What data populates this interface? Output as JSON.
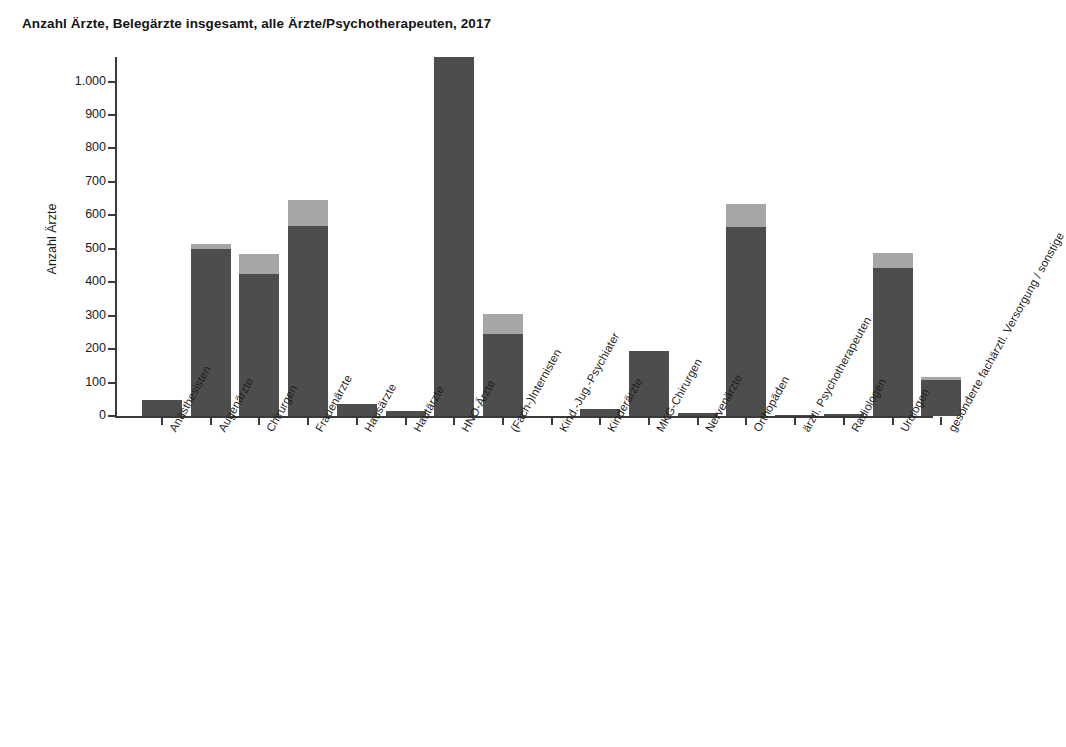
{
  "chart_data": {
    "type": "bar",
    "title": "Anzahl Ärzte, Belegärzte insgesamt, alle Ärzte/Psychotherapeuten, 2017",
    "xlabel": "",
    "ylabel": "Anzahl Ärzte",
    "ylim": [
      0,
      1100
    ],
    "ytick_labels": [
      "1.000",
      "900",
      "800",
      "700",
      "600",
      "500",
      "400",
      "300",
      "200",
      "100",
      "0"
    ],
    "ytick_values": [
      1000,
      900,
      800,
      700,
      600,
      500,
      400,
      300,
      200,
      100,
      0
    ],
    "grid": false,
    "legend": "none",
    "stacked": true,
    "note": "Gestapelte Balken: dunkelgrauer Sockel und hellgraues Segment obenauf. Der Balken HNO-Ärzte ist oben abgeschnitten.",
    "categories": [
      "Anästhesisten",
      "Augenärzte",
      "Chirurgen",
      "Frauenärzte",
      "Hausärzte",
      "Hautärzte",
      "HNO-Ärzte",
      "(Fach-)Internisten",
      "Kind.-Jug.-Psychiater",
      "Kinderärzte",
      "MKG-Chirurgen",
      "Nervenärzte",
      "Orthopäden",
      "ärztl. Psychotherapeuten",
      "Radiologen",
      "Urologen",
      "gesonderte fachärztl. Versorgung / sonstige"
    ],
    "series": [
      {
        "name": "Belegärzte",
        "color": "#4d4d4d",
        "values": [
          48,
          498,
          423,
          567,
          36,
          15,
          1075,
          245,
          0,
          20,
          195,
          8,
          564,
          2,
          6,
          442,
          108
        ]
      },
      {
        "name": "weitere Ärzte",
        "color": "#a6a6a6",
        "values": [
          0,
          15,
          60,
          78,
          0,
          0,
          0,
          60,
          0,
          0,
          0,
          0,
          69,
          0,
          0,
          45,
          8
        ]
      }
    ],
    "totals": [
      48,
      513,
      483,
      645,
      36,
      15,
      1075,
      305,
      0,
      20,
      195,
      8,
      633,
      2,
      6,
      487,
      116
    ]
  },
  "colors": {
    "bar_base": "#4d4d4d",
    "bar_top": "#a6a6a6",
    "axis": "#3a3a3a",
    "text": "#1a1a1a",
    "background": "#ffffff"
  }
}
